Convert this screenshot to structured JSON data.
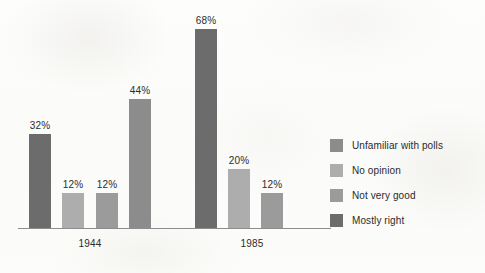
{
  "chart_data": {
    "type": "bar",
    "title": "",
    "subtitle": "",
    "xlabel": "",
    "ylabel": "",
    "ylim": [
      0,
      75
    ],
    "grid": false,
    "legend_position": "right",
    "categories": [
      "1944",
      "1985"
    ],
    "series": [
      {
        "name": "Unfamiliar with polls",
        "color": "#8c8c8c",
        "values": [
          44,
          null
        ]
      },
      {
        "name": "No opinion",
        "color": "#adadad",
        "values": [
          12,
          20
        ]
      },
      {
        "name": "Not very good",
        "color": "#9b9b9b",
        "values": [
          12,
          12
        ]
      },
      {
        "name": "Mostly right",
        "color": "#6c6c6c",
        "values": [
          32,
          68
        ]
      }
    ],
    "bars": [
      {
        "group": "1944",
        "series": "Mostly right",
        "value": 32,
        "label": "32%",
        "color": "#6c6c6c"
      },
      {
        "group": "1944",
        "series": "No opinion",
        "value": 12,
        "label": "12%",
        "color": "#adadad"
      },
      {
        "group": "1944",
        "series": "Not very good",
        "value": 12,
        "label": "12%",
        "color": "#9b9b9b"
      },
      {
        "group": "1944",
        "series": "Unfamiliar with polls",
        "value": 44,
        "label": "44%",
        "color": "#8c8c8c"
      },
      {
        "group": "1985",
        "series": "Mostly right",
        "value": 68,
        "label": "68%",
        "color": "#6c6c6c"
      },
      {
        "group": "1985",
        "series": "No opinion",
        "value": 20,
        "label": "20%",
        "color": "#adadad"
      },
      {
        "group": "1985",
        "series": "Not very good",
        "value": 12,
        "label": "12%",
        "color": "#9b9b9b"
      }
    ]
  },
  "axis": {
    "group_labels": [
      {
        "text": "1944"
      },
      {
        "text": "1985"
      }
    ]
  },
  "legend": {
    "items": [
      {
        "label": "Unfamiliar with polls",
        "color": "#8c8c8c"
      },
      {
        "label": "No opinion",
        "color": "#adadad"
      },
      {
        "label": "Not very good",
        "color": "#9b9b9b"
      },
      {
        "label": "Mostly right",
        "color": "#6c6c6c"
      }
    ]
  },
  "colors": {
    "background": "#fdfdfc",
    "axis_line": "#8d8d8d",
    "text": "#2c2c2c"
  }
}
